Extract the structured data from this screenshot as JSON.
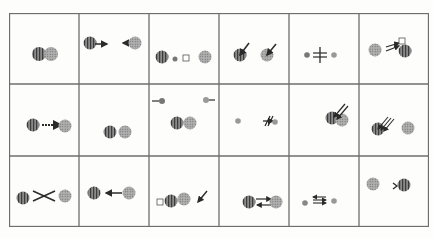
{
  "figure": {
    "type": "grid-of-interaction-diagrams",
    "rows": 3,
    "columns": 6,
    "border_color": "#6e6e6e",
    "colors": {
      "striped_circle": "#7d7d7d",
      "dotted_circle": "#9c9c9c",
      "ink": "#2a2a2a",
      "paper": "#fdfdfb"
    },
    "cells": [
      {
        "row": 1,
        "col": 1,
        "description": "striped circle and dotted circle fused/touching"
      },
      {
        "row": 1,
        "col": 2,
        "description": "striped circle with arrow right, arrow left into dotted circle"
      },
      {
        "row": 1,
        "col": 3,
        "description": "striped circle, small dot, small square, dotted circle"
      },
      {
        "row": 1,
        "col": 4,
        "description": "striped circle and dotted circle each struck by a diagonal arrow"
      },
      {
        "row": 1,
        "col": 5,
        "description": "two small dots separated by a crossed double line"
      },
      {
        "row": 1,
        "col": 6,
        "description": "dotted circle, double arrow to small square above striped circle"
      },
      {
        "row": 2,
        "col": 1,
        "description": "striped circle linked to dotted circle by dashed arrow"
      },
      {
        "row": 2,
        "col": 2,
        "description": "striped circle and dotted circle side by side"
      },
      {
        "row": 2,
        "col": 3,
        "description": "small dot with stub left, small dot with stub right, striped and dotted circles touching"
      },
      {
        "row": 2,
        "col": 4,
        "description": "two small dots with crossed arrow between"
      },
      {
        "row": 2,
        "col": 5,
        "description": "overlapping striped and dotted circles with double diagonal arrow"
      },
      {
        "row": 2,
        "col": 6,
        "description": "striped circle hit by triple arrow, dotted circle"
      },
      {
        "row": 3,
        "col": 1,
        "description": "striped circle and dotted circle with crossing lines between"
      },
      {
        "row": 3,
        "col": 2,
        "description": "striped circle, arrow pointing left from dotted circle"
      },
      {
        "row": 3,
        "col": 3,
        "description": "small square, striped circle, dotted circle in a row, diagonal arrow"
      },
      {
        "row": 3,
        "col": 4,
        "description": "striped circle and dotted circle with opposing arrows (exchange)"
      },
      {
        "row": 3,
        "col": 5,
        "description": "two small dots with multiple opposing arrows"
      },
      {
        "row": 3,
        "col": 6,
        "description": "dotted circle, angle bracket, striped circle"
      }
    ]
  }
}
